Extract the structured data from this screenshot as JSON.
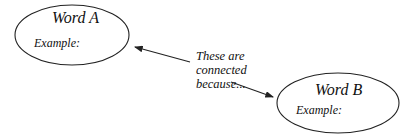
{
  "nodes": [
    {
      "id": "word_a",
      "title": "Word A",
      "example_label": "Example:"
    },
    {
      "id": "word_b",
      "title": "Word B",
      "example_label": "Example:"
    }
  ],
  "connector": {
    "lines": [
      "These are",
      "connected",
      "because..."
    ]
  },
  "colors": {
    "stroke": "#222222",
    "text": "#111111",
    "background": "#ffffff"
  }
}
